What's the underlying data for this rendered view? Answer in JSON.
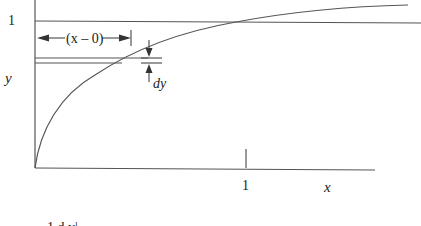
{
  "diagram": {
    "y_axis_label": "y",
    "x_axis_label": "x",
    "y_tick_label": "1",
    "x_tick_label": "1",
    "interval_label": "(x – 0)",
    "dy_label": "dy",
    "bottom_cut_text": "1   d   y|"
  },
  "colors": {
    "line": "#555555",
    "text": "#222222"
  }
}
